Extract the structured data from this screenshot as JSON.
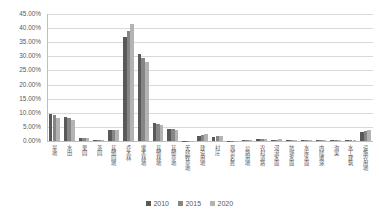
{
  "chart_data": {
    "type": "bar",
    "title": "",
    "xlabel": "",
    "ylabel": "",
    "ylim": [
      0,
      45
    ],
    "ytick_labels": [
      "0.00%",
      "5.00%",
      "10.00%",
      "15.00%",
      "20.00%",
      "25.00%",
      "30.00%",
      "35.00%",
      "40.00%",
      "45.00%"
    ],
    "ytick_values": [
      0,
      5,
      10,
      15,
      20,
      25,
      30,
      35,
      40,
      45
    ],
    "grid": "horizontal",
    "legend_position": "bottom-center",
    "categories": [
      "旱地",
      "水田",
      "果园",
      "茶园",
      "其他园地",
      "乔木林",
      "灌木林地",
      "其他林地",
      "其他草地",
      "天然牧草地",
      "建设用地",
      "村庄",
      "风景名胜",
      "公路用地",
      "农村道路",
      "河流水面",
      "坑塘水面",
      "水库水面",
      "内陆滩涂",
      "沟渠",
      "水工建筑",
      "设施农用地"
    ],
    "series": [
      {
        "name": "2010",
        "color": "#595959",
        "values": [
          9.6,
          8.4,
          1.0,
          0.5,
          4.0,
          37.0,
          31.0,
          6.4,
          4.4,
          0.15,
          1.7,
          1.6,
          0.05,
          0.35,
          0.7,
          0.5,
          0.45,
          0.3,
          0.25,
          0.45,
          0.2,
          3.2
        ]
      },
      {
        "name": "2015",
        "color": "#868686",
        "values": [
          9.1,
          8.0,
          0.95,
          0.5,
          3.9,
          39.0,
          29.5,
          6.0,
          4.2,
          0.15,
          2.1,
          1.7,
          0.05,
          0.4,
          0.8,
          0.5,
          0.5,
          0.35,
          0.25,
          0.5,
          0.25,
          3.6
        ]
      },
      {
        "name": "2020",
        "color": "#b3b3b3",
        "values": [
          8.3,
          7.6,
          0.9,
          0.45,
          3.8,
          41.5,
          28.0,
          5.5,
          4.0,
          0.15,
          2.4,
          1.8,
          0.05,
          0.45,
          0.85,
          0.55,
          0.5,
          0.4,
          0.3,
          0.5,
          0.25,
          3.9
        ]
      }
    ]
  },
  "legend": {
    "items": [
      {
        "label": "2010",
        "color": "#595959"
      },
      {
        "label": "2015",
        "color": "#868686"
      },
      {
        "label": "2020",
        "color": "#b3b3b3"
      }
    ]
  },
  "colors": {
    "gridline": "#d9d9d9",
    "axis": "#bfbfbf",
    "text": "#595959",
    "background": "#ffffff"
  }
}
